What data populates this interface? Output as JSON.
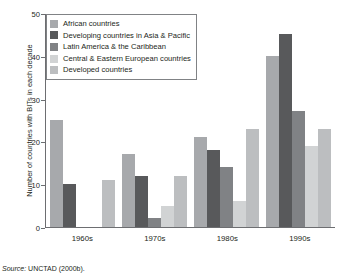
{
  "chart_data": {
    "type": "bar",
    "title": "",
    "xlabel": "",
    "ylabel": "Number of countries with BITs in each decade",
    "ylim": [
      0,
      50
    ],
    "yticks": [
      0,
      10,
      20,
      30,
      40,
      50
    ],
    "grid": false,
    "legend_position": "top-left",
    "categories": [
      "1960s",
      "1970s",
      "1980s",
      "1990s"
    ],
    "series": [
      {
        "name": "African countries",
        "color": "#a7a9ac",
        "values": [
          25,
          17,
          21,
          40
        ]
      },
      {
        "name": "Developing countries in Asia & Pacific",
        "color": "#58595b",
        "values": [
          10,
          12,
          18,
          45
        ]
      },
      {
        "name": "Latin America & the Caribbean",
        "color": "#808285",
        "values": [
          0,
          2,
          14,
          27
        ]
      },
      {
        "name": "Central & Eastern European countries",
        "color": "#d1d3d4",
        "values": [
          0,
          5,
          6,
          19
        ]
      },
      {
        "name": "Developed countries",
        "color": "#bcbec0",
        "values": [
          11,
          12,
          23,
          23
        ]
      }
    ],
    "source_lead": "Source:",
    "source_text": "UNCTAD (2000b)."
  }
}
